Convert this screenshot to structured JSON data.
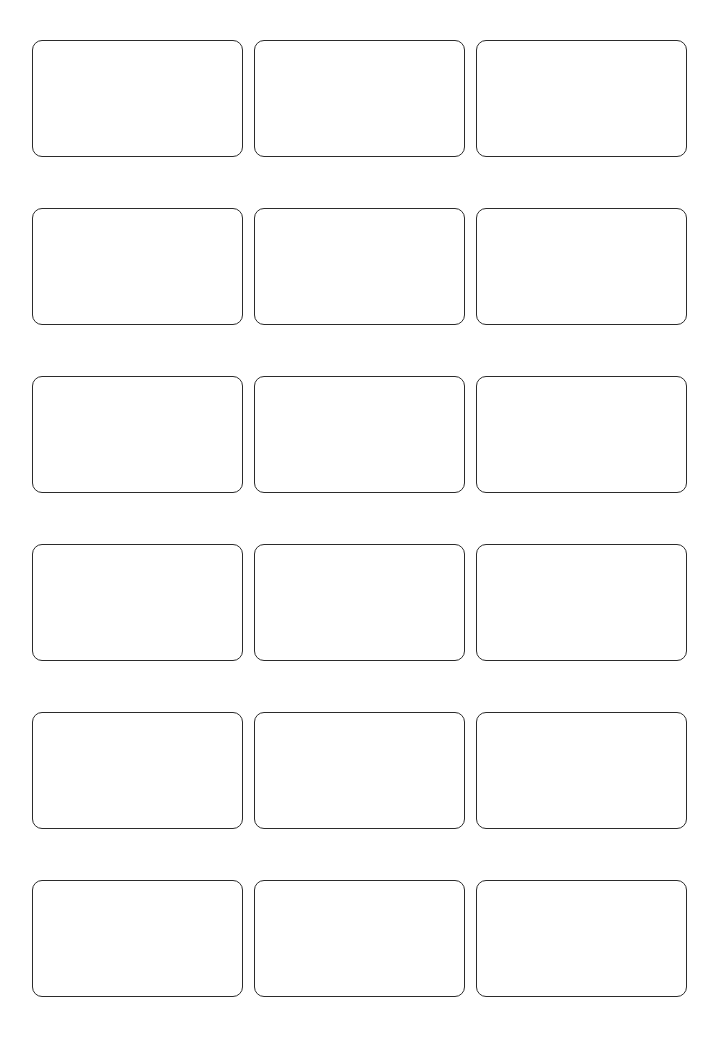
{
  "page": {
    "background_color": "#ffffff",
    "width": 722,
    "height": 1050
  },
  "sheet": {
    "rows": 6,
    "columns": 3,
    "total_cards": 18,
    "card_width": 211,
    "card_height": 117,
    "corner_radius": 10,
    "border_width": 1.4,
    "border_color": "#2b2b2b",
    "card_fill": "#ffffff",
    "column_gap": 11,
    "row_gap": 51,
    "margin_left": 32,
    "margin_top": 40
  },
  "cards": [
    {
      "id": "card-r1-c1",
      "row": 1,
      "column": 1,
      "text": ""
    },
    {
      "id": "card-r1-c2",
      "row": 1,
      "column": 2,
      "text": ""
    },
    {
      "id": "card-r1-c3",
      "row": 1,
      "column": 3,
      "text": ""
    },
    {
      "id": "card-r2-c1",
      "row": 2,
      "column": 1,
      "text": ""
    },
    {
      "id": "card-r2-c2",
      "row": 2,
      "column": 2,
      "text": ""
    },
    {
      "id": "card-r2-c3",
      "row": 2,
      "column": 3,
      "text": ""
    },
    {
      "id": "card-r3-c1",
      "row": 3,
      "column": 1,
      "text": ""
    },
    {
      "id": "card-r3-c2",
      "row": 3,
      "column": 2,
      "text": ""
    },
    {
      "id": "card-r3-c3",
      "row": 3,
      "column": 3,
      "text": ""
    },
    {
      "id": "card-r4-c1",
      "row": 4,
      "column": 1,
      "text": ""
    },
    {
      "id": "card-r4-c2",
      "row": 4,
      "column": 2,
      "text": ""
    },
    {
      "id": "card-r4-c3",
      "row": 4,
      "column": 3,
      "text": ""
    },
    {
      "id": "card-r5-c1",
      "row": 5,
      "column": 1,
      "text": ""
    },
    {
      "id": "card-r5-c2",
      "row": 5,
      "column": 2,
      "text": ""
    },
    {
      "id": "card-r5-c3",
      "row": 5,
      "column": 3,
      "text": ""
    },
    {
      "id": "card-r6-c1",
      "row": 6,
      "column": 1,
      "text": ""
    },
    {
      "id": "card-r6-c2",
      "row": 6,
      "column": 2,
      "text": ""
    },
    {
      "id": "card-r6-c3",
      "row": 6,
      "column": 3,
      "text": ""
    }
  ]
}
